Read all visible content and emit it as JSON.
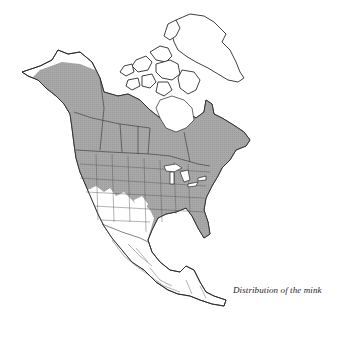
{
  "figure": {
    "caption": "Distribution of the mink",
    "region": "North America",
    "legend": {
      "shaded_meaning": "Range / distribution area",
      "shaded_color": "#a9a9a9",
      "unshaded_color": "#ffffff",
      "outline_color": "#2a2a2a"
    },
    "range_summary": {
      "included": [
        "Alaska (interior and south)",
        "Canada (except high Arctic and Arctic islands)",
        "Most of the contiguous United States"
      ],
      "excluded": [
        "Arctic Archipelago",
        "Greenland",
        "Northern Alaska coastal tundra",
        "Arid Southwest US (Nevada, Utah, Arizona, New Mexico, southern California)",
        "Western Texas",
        "Mexico",
        "Central America"
      ]
    }
  }
}
